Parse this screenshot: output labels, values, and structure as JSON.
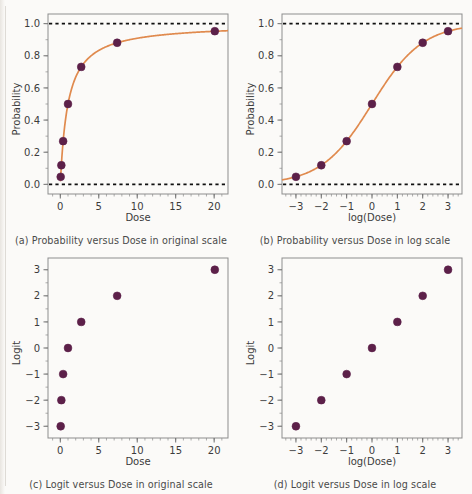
{
  "figure": {
    "background_color": "#fbfaf8",
    "marker_color": "#5c2049",
    "curve_color": "#e08a4e",
    "refline_color": "#101010",
    "frame_color": "#8d8d8d",
    "cut_off_top_text": ""
  },
  "panels": [
    {
      "id": "a",
      "caption": "(a) Probability versus Dose in original scale",
      "xlabel": "Dose",
      "ylabel": "Probability",
      "xticks": [
        "0",
        "5",
        "10",
        "15",
        "20"
      ],
      "yticks": [
        "0.0",
        "0.2",
        "0.4",
        "0.6",
        "0.8",
        "1.0"
      ]
    },
    {
      "id": "b",
      "caption": "(b) Probability versus Dose in log scale",
      "xlabel": "log(Dose)",
      "ylabel": "Probability",
      "xticks": [
        "−3",
        "−2",
        "−1",
        "0",
        "1",
        "2",
        "3"
      ],
      "yticks": [
        "0.0",
        "0.2",
        "0.4",
        "0.6",
        "0.8",
        "1.0"
      ]
    },
    {
      "id": "c",
      "caption": "(c) Logit versus Dose in original scale",
      "xlabel": "Dose",
      "ylabel": "Logit",
      "xticks": [
        "0",
        "5",
        "10",
        "15",
        "20"
      ],
      "yticks": [
        "−3",
        "−2",
        "−1",
        "0",
        "1",
        "2",
        "3"
      ]
    },
    {
      "id": "d",
      "caption": "(d) Logit versus Dose in log scale",
      "xlabel": "log(Dose)",
      "ylabel": "Logit",
      "xticks": [
        "−3",
        "−2",
        "−1",
        "0",
        "1",
        "2",
        "3"
      ],
      "yticks": [
        "−3",
        "−2",
        "−1",
        "0",
        "1",
        "2",
        "3"
      ]
    }
  ],
  "chart_data": [
    {
      "type": "scatter",
      "panel": "a",
      "title": "(a) Probability versus Dose in original scale",
      "xlabel": "Dose",
      "ylabel": "Probability",
      "xlim": [
        -1.6,
        21.8
      ],
      "ylim": [
        -0.06,
        1.06
      ],
      "xticks": [
        0,
        5,
        10,
        15,
        20
      ],
      "yticks": [
        0.0,
        0.2,
        0.4,
        0.6,
        0.8,
        1.0
      ],
      "grid": false,
      "legend": "none",
      "x": [
        0.0498,
        0.1353,
        0.3679,
        1.0,
        2.7183,
        7.3891,
        20.0855
      ],
      "y": [
        0.047,
        0.119,
        0.269,
        0.5,
        0.731,
        0.881,
        0.953
      ],
      "reference_lines": [
        {
          "y": 0.0,
          "style": "dashed"
        },
        {
          "y": 1.0,
          "style": "dashed"
        }
      ],
      "fitted_curve": {
        "label": "logistic curve",
        "equation": "p = x / (1 + x)",
        "color": "#e08a4e"
      }
    },
    {
      "type": "scatter",
      "panel": "b",
      "title": "(b) Probability versus Dose in log scale",
      "xlabel": "log(Dose)",
      "ylabel": "Probability",
      "xlim": [
        -3.55,
        3.55
      ],
      "ylim": [
        -0.06,
        1.06
      ],
      "xticks": [
        -3,
        -2,
        -1,
        0,
        1,
        2,
        3
      ],
      "yticks": [
        0.0,
        0.2,
        0.4,
        0.6,
        0.8,
        1.0
      ],
      "grid": false,
      "legend": "none",
      "x": [
        -3,
        -2,
        -1,
        0,
        1,
        2,
        3
      ],
      "y": [
        0.047,
        0.119,
        0.269,
        0.5,
        0.731,
        0.881,
        0.953
      ],
      "reference_lines": [
        {
          "y": 0.0,
          "style": "dashed"
        },
        {
          "y": 1.0,
          "style": "dashed"
        }
      ],
      "fitted_curve": {
        "label": "logistic curve",
        "equation": "p = 1 / (1 + exp(-u))",
        "color": "#e08a4e"
      }
    },
    {
      "type": "scatter",
      "panel": "c",
      "title": "(c) Logit versus Dose in original scale",
      "xlabel": "Dose",
      "ylabel": "Logit",
      "xlim": [
        -1.6,
        21.8
      ],
      "ylim": [
        -3.45,
        3.45
      ],
      "xticks": [
        0,
        5,
        10,
        15,
        20
      ],
      "yticks": [
        -3,
        -2,
        -1,
        0,
        1,
        2,
        3
      ],
      "grid": false,
      "legend": "none",
      "x": [
        0.0498,
        0.1353,
        0.3679,
        1.0,
        2.7183,
        7.3891,
        20.0855
      ],
      "y": [
        -3,
        -2,
        -1,
        0,
        1,
        2,
        3
      ]
    },
    {
      "type": "scatter",
      "panel": "d",
      "title": "(d) Logit versus Dose in log scale",
      "xlabel": "log(Dose)",
      "ylabel": "Logit",
      "xlim": [
        -3.55,
        3.55
      ],
      "ylim": [
        -3.45,
        3.45
      ],
      "xticks": [
        -3,
        -2,
        -1,
        0,
        1,
        2,
        3
      ],
      "yticks": [
        -3,
        -2,
        -1,
        0,
        1,
        2,
        3
      ],
      "grid": false,
      "legend": "none",
      "x": [
        -3,
        -2,
        -1,
        0,
        1,
        2,
        3
      ],
      "y": [
        -3,
        -2,
        -1,
        0,
        1,
        2,
        3
      ]
    }
  ]
}
